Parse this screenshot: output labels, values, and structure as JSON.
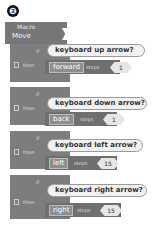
{
  "figure_label": "❷",
  "procedure": {
    "label_small": "Macro",
    "name": "Move"
  },
  "blocks": [
    {
      "if_label": "if",
      "then_label": "then",
      "condition": "keyboard up arrow?",
      "direction": "forward",
      "steps_label": "steps",
      "value": "1"
    },
    {
      "if_label": "if",
      "then_label": "then",
      "condition": "keyboard down arrow?",
      "direction": "back",
      "steps_label": "steps",
      "value": "1"
    },
    {
      "if_label": "if",
      "then_label": "then",
      "condition": "keyboard left arrow?",
      "direction": "left",
      "steps_label": "steps",
      "value": "15"
    },
    {
      "if_label": "if",
      "then_label": "then",
      "condition": "keyboard right arrow?",
      "direction": "right",
      "steps_label": "steps",
      "value": "15"
    }
  ],
  "colors": {
    "block_dark": "#6f6f6f",
    "block": "#7d7d7d",
    "pill": "#f1f1f1"
  }
}
